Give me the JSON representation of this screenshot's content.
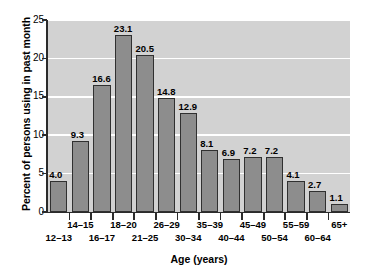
{
  "chart_data": {
    "type": "bar",
    "title": "",
    "xlabel": "Age (years)",
    "ylabel": "Percent of persons using in past month",
    "categories": [
      "12–13",
      "14–15",
      "16–17",
      "18–20",
      "21–25",
      "26–29",
      "30–34",
      "35–39",
      "40–44",
      "45–49",
      "50–54",
      "55–59",
      "60–64",
      "65+"
    ],
    "values": [
      4.0,
      9.3,
      16.6,
      23.1,
      20.5,
      14.8,
      12.9,
      8.1,
      6.9,
      7.2,
      7.2,
      4.1,
      2.7,
      1.1
    ],
    "value_labels": [
      "4.0",
      "9.3",
      "16.6",
      "23.1",
      "20.5",
      "14.8",
      "12.9",
      "8.1",
      "6.9",
      "7.2",
      "7.2",
      "4.1",
      "2.7",
      "1.1"
    ],
    "ylim": [
      0,
      25
    ],
    "yticks": [
      0,
      5,
      10,
      15,
      20,
      25
    ],
    "ytick_labels": [
      "0",
      "5",
      "10",
      "15",
      "20",
      "25"
    ],
    "grid": "horizontal-white",
    "legend": null,
    "label_rows": [
      "bottom",
      "top",
      "bottom",
      "top",
      "bottom",
      "top",
      "bottom",
      "top",
      "bottom",
      "top",
      "bottom",
      "top",
      "bottom",
      "top"
    ],
    "colors": {
      "bar_fill": "#8d8d8d",
      "bar_edge": "#303030",
      "plot_background": "#d2d2d2",
      "gridline": "#ffffff",
      "axis": "#2b2b2b",
      "text": "#000000",
      "figure_background": "#ffffff"
    }
  }
}
